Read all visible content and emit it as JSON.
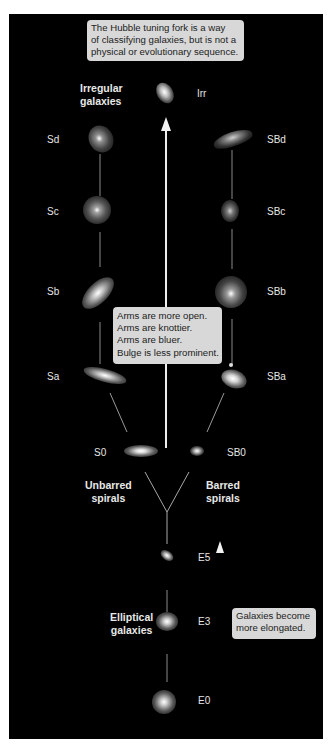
{
  "diagram": {
    "title_note": "The Hubble tuning fork is a way of classifying galaxies, but is not a physical or evolutionary sequence.",
    "title_note_lines": [
      "The Hubble tuning fork is a way",
      "of classifying galaxies, but is not a",
      "physical or evolutionary sequence."
    ],
    "spiral_trend_note_lines": [
      "Arms are more open.",
      "Arms are knottier.",
      "Arms are bluer.",
      "Bulge is less prominent."
    ],
    "elliptical_trend_note_lines": [
      "Galaxies become",
      "more elongated."
    ],
    "groups": {
      "irregular": [
        "Irregular",
        "galaxies"
      ],
      "unbarred": [
        "Unbarred",
        "spirals"
      ],
      "barred": [
        "Barred",
        "spirals"
      ],
      "elliptical": [
        "Elliptical",
        "galaxies"
      ]
    },
    "classes": {
      "irregular": "Irr",
      "unbarred": [
        "Sd",
        "Sc",
        "Sb",
        "Sa",
        "S0"
      ],
      "barred": [
        "SBd",
        "SBc",
        "SBb",
        "SBa",
        "SB0"
      ],
      "elliptical": [
        "E5",
        "E3",
        "E0"
      ]
    },
    "colors": {
      "background": "#000000",
      "page": "#ffffff",
      "caption_box": "#d8d8d8",
      "caption_text": "#222222",
      "label_text": "#e6e6e6",
      "lines": "#bfbfbf",
      "arrow": "#f2f2f2"
    }
  }
}
